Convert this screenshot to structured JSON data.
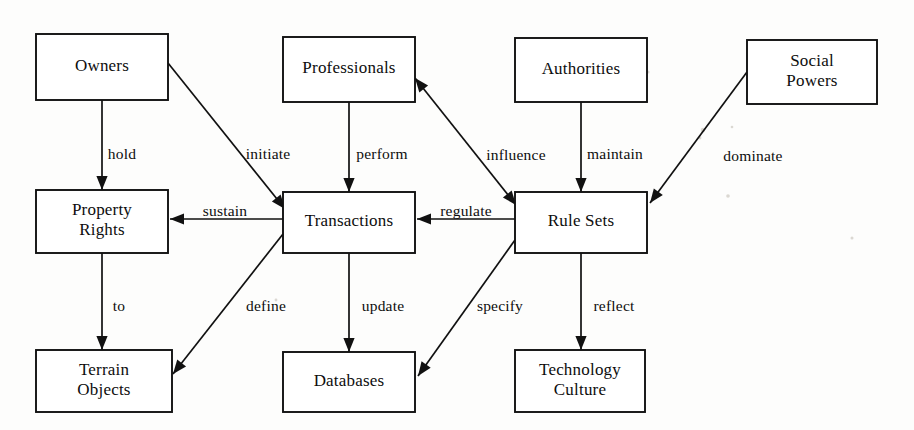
{
  "diagram": {
    "width": 914,
    "height": 430,
    "background_color": "#fdfdfc",
    "line_color": "#111111",
    "text_color": "#0d0d0d",
    "box_fill": "#ffffff",
    "nodes": [
      {
        "id": "owners",
        "label": "Owners",
        "lines": [
          "Owners"
        ],
        "x": 36,
        "y": 34,
        "w": 132,
        "h": 66
      },
      {
        "id": "professionals",
        "label": "Professionals",
        "lines": [
          "Professionals"
        ],
        "x": 283,
        "y": 37,
        "w": 132,
        "h": 65
      },
      {
        "id": "authorities",
        "label": "Authorities",
        "lines": [
          "Authorities"
        ],
        "x": 515,
        "y": 38,
        "w": 132,
        "h": 64
      },
      {
        "id": "social-powers",
        "label": "Social Powers",
        "lines": [
          "Social",
          "Powers"
        ],
        "x": 747,
        "y": 40,
        "w": 130,
        "h": 64
      },
      {
        "id": "property-rights",
        "label": "Property Rights",
        "lines": [
          "Property",
          "Rights"
        ],
        "x": 36,
        "y": 190,
        "w": 132,
        "h": 63
      },
      {
        "id": "transactions",
        "label": "Transactions",
        "lines": [
          "Transactions"
        ],
        "x": 283,
        "y": 192,
        "w": 132,
        "h": 61
      },
      {
        "id": "rule-sets",
        "label": "Rule Sets",
        "lines": [
          "Rule Sets"
        ],
        "x": 515,
        "y": 192,
        "w": 132,
        "h": 61
      },
      {
        "id": "terrain-objects",
        "label": "Terrain Objects",
        "lines": [
          "Terrain",
          "Objects"
        ],
        "x": 36,
        "y": 350,
        "w": 136,
        "h": 62
      },
      {
        "id": "databases",
        "label": "Databases",
        "lines": [
          "Databases"
        ],
        "x": 283,
        "y": 352,
        "w": 132,
        "h": 60
      },
      {
        "id": "technology-culture",
        "label": "Technology Culture",
        "lines": [
          "Technology",
          "Culture"
        ],
        "x": 515,
        "y": 350,
        "w": 130,
        "h": 62
      }
    ],
    "edges": [
      {
        "id": "hold",
        "label": "hold",
        "from": "owners",
        "to": "property-rights",
        "x1": 102,
        "y1": 100,
        "x2": 102,
        "y2": 190,
        "arrow_start": false,
        "arrow_end": true,
        "lx": 122,
        "ly": 155
      },
      {
        "id": "initiate",
        "label": "initiate",
        "from": "owners",
        "to": "transactions",
        "x1": 168,
        "y1": 63,
        "x2": 285,
        "y2": 209,
        "arrow_start": false,
        "arrow_end": true,
        "lx": 268,
        "ly": 155
      },
      {
        "id": "perform",
        "label": "perform",
        "from": "professionals",
        "to": "transactions",
        "x1": 349,
        "y1": 102,
        "x2": 349,
        "y2": 192,
        "arrow_start": false,
        "arrow_end": true,
        "lx": 382,
        "ly": 155
      },
      {
        "id": "influence",
        "label": "influence",
        "from": "rule-sets",
        "to": "professionals",
        "x1": 415,
        "y1": 78,
        "x2": 516,
        "y2": 205,
        "arrow_start": true,
        "arrow_end": true,
        "lx": 516,
        "ly": 156
      },
      {
        "id": "maintain",
        "label": "maintain",
        "from": "authorities",
        "to": "rule-sets",
        "x1": 581,
        "y1": 102,
        "x2": 581,
        "y2": 192,
        "arrow_start": false,
        "arrow_end": true,
        "lx": 615,
        "ly": 155
      },
      {
        "id": "dominate",
        "label": "dominate",
        "from": "social-powers",
        "to": "rule-sets",
        "x1": 747,
        "y1": 72,
        "x2": 650,
        "y2": 203,
        "arrow_start": false,
        "arrow_end": true,
        "lx": 753,
        "ly": 157
      },
      {
        "id": "sustain",
        "label": "sustain",
        "from": "transactions",
        "to": "property-rights",
        "x1": 283,
        "y1": 219,
        "x2": 170,
        "y2": 219,
        "arrow_start": false,
        "arrow_end": true,
        "lx": 225,
        "ly": 212
      },
      {
        "id": "regulate",
        "label": "regulate",
        "from": "rule-sets",
        "to": "transactions",
        "x1": 515,
        "y1": 219,
        "x2": 417,
        "y2": 219,
        "arrow_start": false,
        "arrow_end": true,
        "lx": 466,
        "ly": 212
      },
      {
        "id": "to",
        "label": "to",
        "from": "property-rights",
        "to": "terrain-objects",
        "x1": 102,
        "y1": 253,
        "x2": 102,
        "y2": 350,
        "arrow_start": false,
        "arrow_end": true,
        "lx": 119,
        "ly": 307
      },
      {
        "id": "define",
        "label": "define",
        "from": "transactions",
        "to": "terrain-objects",
        "x1": 283,
        "y1": 234,
        "x2": 173,
        "y2": 374,
        "arrow_start": false,
        "arrow_end": true,
        "lx": 266,
        "ly": 307
      },
      {
        "id": "update",
        "label": "update",
        "from": "transactions",
        "to": "databases",
        "x1": 349,
        "y1": 253,
        "x2": 349,
        "y2": 352,
        "arrow_start": false,
        "arrow_end": true,
        "lx": 383,
        "ly": 307
      },
      {
        "id": "specify",
        "label": "specify",
        "from": "rule-sets",
        "to": "databases",
        "x1": 515,
        "y1": 240,
        "x2": 418,
        "y2": 376,
        "arrow_start": false,
        "arrow_end": true,
        "lx": 500,
        "ly": 307
      },
      {
        "id": "reflect",
        "label": "reflect",
        "from": "rule-sets",
        "to": "technology-culture",
        "x1": 581,
        "y1": 253,
        "x2": 581,
        "y2": 350,
        "arrow_start": false,
        "arrow_end": true,
        "lx": 614,
        "ly": 307
      }
    ],
    "specks": [
      {
        "x": 634,
        "y": 66,
        "r": 3.0
      },
      {
        "x": 648,
        "y": 72,
        "r": 1.6
      },
      {
        "x": 703,
        "y": 130,
        "r": 2.2
      },
      {
        "x": 700,
        "y": 138,
        "r": 1.4
      },
      {
        "x": 732,
        "y": 127,
        "r": 1.3
      },
      {
        "x": 728,
        "y": 196,
        "r": 1.8
      },
      {
        "x": 276,
        "y": 300,
        "r": 1.4
      },
      {
        "x": 852,
        "y": 238,
        "r": 1.5
      }
    ]
  }
}
